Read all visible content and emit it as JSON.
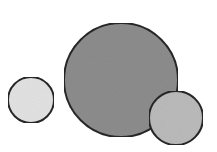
{
  "diagram": {
    "type": "circles",
    "background": "#ffffff",
    "stroke_color": "#2a2a2a",
    "stroke_width": 2,
    "circles": [
      {
        "id": "small-left",
        "cx": 31,
        "cy": 100,
        "r": 23,
        "fill": "#e4e4e4"
      },
      {
        "id": "large-center",
        "cx": 121,
        "cy": 80,
        "r": 57,
        "fill": "#8e8e8e"
      },
      {
        "id": "medium-right",
        "cx": 176,
        "cy": 118,
        "r": 27,
        "fill": "#bcbcbc"
      }
    ]
  }
}
